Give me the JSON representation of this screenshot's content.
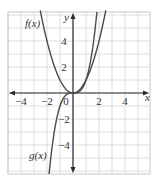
{
  "chart_data": {
    "type": "line",
    "title": "",
    "xlabel": "x",
    "ylabel": "y",
    "xlim": [
      -5,
      5.8
    ],
    "ylim": [
      -6,
      6.2
    ],
    "grid": true,
    "x_ticks": [
      -4,
      -2,
      0,
      2,
      4
    ],
    "x_tick_labels": [
      "−4",
      "−2",
      "0",
      "2",
      "4"
    ],
    "y_ticks": [
      -4,
      -2,
      2,
      4
    ],
    "y_tick_labels": [
      "−4",
      "−2",
      "2",
      "4"
    ],
    "series": [
      {
        "name": "f(x)",
        "expression": "x^2",
        "label": "f(x)"
      },
      {
        "name": "g(x)",
        "expression": "x^3",
        "label": "g(x)"
      }
    ]
  },
  "labels": {
    "x_axis": "x",
    "y_axis": "y",
    "f": "f(x)",
    "g": "g(x)"
  },
  "colors": {
    "curve": "#4a4a4a",
    "axis": "#2a2a2a",
    "grid": "#d6d6d6",
    "frame": "#c8c8c8"
  }
}
